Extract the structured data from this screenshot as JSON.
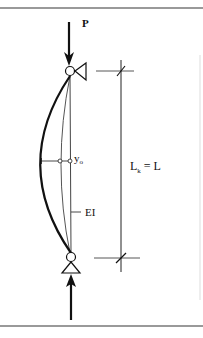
{
  "figure": {
    "load_label": "P",
    "deflection_label": "y",
    "deflection_subscript": "o",
    "stiffness_label": "EI",
    "length_label_main": "L",
    "length_label_subscript": "k",
    "length_label_rest": " = L"
  },
  "colors": {
    "ink": "#111111",
    "thin": "#555555",
    "rule": "#777777"
  }
}
